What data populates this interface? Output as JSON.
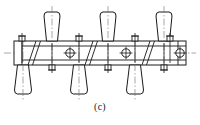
{
  "figure": {
    "caption": "(c)",
    "title": "",
    "type": "engineering-section-drawing",
    "background_color": "#ffffff",
    "line_color": "#1a1a1a",
    "centerline_color": "#6b6b6b",
    "width": 200,
    "height": 125
  },
  "beam": {
    "label": "horizontal-rail-beam",
    "x": 14,
    "y": 41,
    "width": 172,
    "height": 24,
    "inner_top_offset": 5,
    "inner_bottom_offset": 5,
    "left_cap_x": 22,
    "right_cap_x": 178
  },
  "axis": {
    "label": "main-horizontal-centerline",
    "y": 53,
    "x1": 4,
    "x2": 196
  },
  "holes": [
    {
      "label": "through-hole-1",
      "cx": 70,
      "cy": 53,
      "r": 4.2
    },
    {
      "label": "through-hole-2",
      "cx": 126,
      "cy": 53,
      "r": 4.2
    },
    {
      "label": "through-hole-3",
      "cx": 180,
      "cy": 53,
      "r": 4.2
    }
  ],
  "splices": [
    {
      "label": "splice-joint-1",
      "x_top": 36,
      "x_bottom": 28
    },
    {
      "label": "splice-joint-2",
      "x_top": 93,
      "x_bottom": 85
    },
    {
      "label": "splice-joint-3",
      "x_top": 150,
      "x_bottom": 142
    }
  ],
  "upper_fittings": [
    {
      "label": "upper-insulator-1",
      "cx": 52,
      "top_y": 12,
      "top_w": 16,
      "bot_w": 11
    },
    {
      "label": "upper-insulator-2",
      "cx": 108,
      "top_y": 12,
      "top_w": 16,
      "bot_w": 11
    },
    {
      "label": "upper-insulator-3",
      "cx": 164,
      "top_y": 12,
      "top_w": 16,
      "bot_w": 11
    }
  ],
  "lower_fittings": [
    {
      "label": "lower-insulator-1",
      "cx": 23,
      "bot_y": 94,
      "top_w": 11,
      "bot_w": 17
    },
    {
      "label": "lower-insulator-2",
      "cx": 79,
      "bot_y": 94,
      "top_w": 11,
      "bot_w": 17
    },
    {
      "label": "lower-insulator-3",
      "cx": 135,
      "bot_y": 94,
      "top_w": 11,
      "bot_w": 17
    }
  ],
  "top_bolts": [
    {
      "label": "top-bolt-1",
      "cx": 22
    },
    {
      "label": "top-bolt-2",
      "cx": 79
    },
    {
      "label": "top-bolt-3",
      "cx": 135
    },
    {
      "label": "top-bolt-4",
      "cx": 170
    }
  ],
  "bottom_bolts": [
    {
      "label": "bottom-bolt-1",
      "cx": 52
    },
    {
      "label": "bottom-bolt-2",
      "cx": 108
    },
    {
      "label": "bottom-bolt-3",
      "cx": 164
    }
  ]
}
